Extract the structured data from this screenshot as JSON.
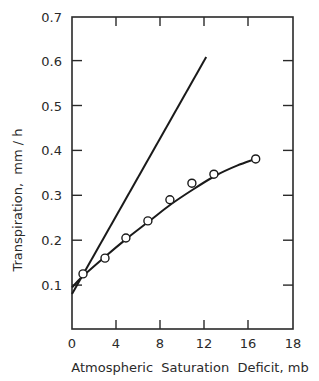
{
  "chart_data": {
    "type": "line",
    "title": "",
    "xlabel": "Atmospheric  Saturation  Deficit, mb",
    "ylabel": "Transpiration,  mm / h",
    "xlim": [
      0,
      18
    ],
    "ylim": [
      0,
      0.7
    ],
    "x_ticks": [
      0,
      4,
      8,
      12,
      16,
      18
    ],
    "x_tick_labels": [
      "0",
      "4",
      "8",
      "12",
      "16",
      "18"
    ],
    "y_ticks": [
      0.1,
      0.2,
      0.3,
      0.4,
      0.5,
      0.6,
      0.7
    ],
    "y_tick_labels": [
      "0.1",
      "0.2",
      "0.3",
      "0.4",
      "0.5",
      "0.6",
      "0.7"
    ],
    "grid": false,
    "legend": null,
    "series": [
      {
        "name": "observed",
        "style": "open-circle markers",
        "x": [
          1.0,
          3.0,
          4.9,
          6.9,
          8.9,
          10.9,
          12.9,
          16.7
        ],
        "y": [
          0.125,
          0.16,
          0.205,
          0.243,
          0.29,
          0.327,
          0.347,
          0.381
        ]
      },
      {
        "name": "fitted-curve",
        "style": "solid curve",
        "x": [
          0,
          1,
          3,
          5,
          7,
          9,
          11,
          13,
          15,
          16.7
        ],
        "y": [
          0.095,
          0.12,
          0.163,
          0.204,
          0.242,
          0.28,
          0.313,
          0.343,
          0.366,
          0.381
        ]
      },
      {
        "name": "straight-line",
        "style": "solid straight line",
        "x": [
          0,
          12.2
        ],
        "y": [
          0.08,
          0.608
        ]
      }
    ]
  }
}
